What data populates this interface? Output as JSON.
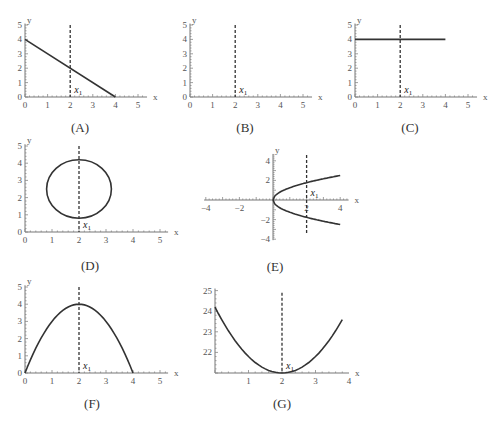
{
  "figure": {
    "panels": [
      {
        "id": "A",
        "label": "(A)",
        "x_axis": "x",
        "y_axis": "y",
        "marker": "x1"
      },
      {
        "id": "B",
        "label": "(B)",
        "x_axis": "x",
        "y_axis": "y",
        "marker": "x1"
      },
      {
        "id": "C",
        "label": "(C)",
        "x_axis": "x",
        "y_axis": "y",
        "marker": "x1"
      },
      {
        "id": "D",
        "label": "(D)",
        "x_axis": "x",
        "y_axis": "y",
        "marker": "x1"
      },
      {
        "id": "E",
        "label": "(E)",
        "x_axis": "x",
        "y_axis": "y",
        "marker": "x1"
      },
      {
        "id": "F",
        "label": "(F)",
        "x_axis": "x",
        "y_axis": "y",
        "marker": "x1"
      },
      {
        "id": "G",
        "label": "(G)",
        "x_axis": "",
        "y_axis": "",
        "marker": "x1"
      }
    ]
  },
  "chart_data": [
    {
      "id": "A",
      "type": "line",
      "title": "(A)",
      "xlabel": "x",
      "ylabel": "y",
      "xlim": [
        0,
        5
      ],
      "ylim": [
        0,
        5
      ],
      "xticks": [
        "0",
        "1",
        "2",
        "3",
        "4",
        "5"
      ],
      "yticks": [
        "0",
        "1",
        "2",
        "3",
        "4",
        "5"
      ],
      "series": [
        {
          "name": "line",
          "x": [
            0,
            4
          ],
          "y": [
            4,
            0
          ]
        }
      ],
      "annotations": [
        {
          "type": "vline-dashed",
          "x": 2,
          "label": "x1"
        }
      ]
    },
    {
      "id": "B",
      "type": "line",
      "title": "(B)",
      "xlabel": "x",
      "ylabel": "y",
      "xlim": [
        0,
        5
      ],
      "ylim": [
        0,
        5
      ],
      "xticks": [
        "0",
        "1",
        "2",
        "3",
        "4",
        "5"
      ],
      "yticks": [
        "0",
        "1",
        "2",
        "3",
        "4",
        "5"
      ],
      "series": [],
      "annotations": [
        {
          "type": "vline-dashed",
          "x": 2,
          "label": "x1"
        }
      ]
    },
    {
      "id": "C",
      "type": "line",
      "title": "(C)",
      "xlabel": "x",
      "ylabel": "y",
      "xlim": [
        0,
        5
      ],
      "ylim": [
        0,
        5
      ],
      "xticks": [
        "0",
        "1",
        "2",
        "3",
        "4",
        "5"
      ],
      "yticks": [
        "0",
        "1",
        "2",
        "3",
        "4",
        "5"
      ],
      "series": [
        {
          "name": "horizontal",
          "x": [
            0,
            4
          ],
          "y": [
            4,
            4
          ]
        }
      ],
      "annotations": [
        {
          "type": "vline-dashed",
          "x": 2,
          "label": "x1"
        }
      ]
    },
    {
      "id": "D",
      "type": "line",
      "title": "(D)",
      "xlabel": "x",
      "ylabel": "y",
      "xlim": [
        0,
        5
      ],
      "ylim": [
        0,
        5
      ],
      "xticks": [
        "0",
        "1",
        "2",
        "3",
        "4",
        "5"
      ],
      "yticks": [
        "0",
        "1",
        "2",
        "3",
        "4",
        "5"
      ],
      "series": [
        {
          "name": "ellipse",
          "center": [
            2,
            2.5
          ],
          "rx": 1.2,
          "ry": 1.7
        }
      ],
      "annotations": [
        {
          "type": "vline-dashed",
          "x": 2,
          "label": "x1"
        }
      ]
    },
    {
      "id": "E",
      "type": "line",
      "title": "(E)",
      "xlabel": "x",
      "ylabel": "y",
      "xlim": [
        -4,
        4.5
      ],
      "ylim": [
        -4,
        4.5
      ],
      "xticks": [
        "-4",
        "-2",
        "2",
        "4"
      ],
      "yticks": [
        "-4",
        "-2",
        "2",
        "4"
      ],
      "series": [
        {
          "name": "upper branch",
          "x": [
            0,
            1,
            2,
            3,
            4
          ],
          "y": [
            0,
            1.25,
            1.77,
            2.17,
            2.5
          ]
        },
        {
          "name": "lower branch",
          "x": [
            0,
            1,
            2,
            3,
            4
          ],
          "y": [
            0,
            -1.25,
            -1.77,
            -2.17,
            -2.5
          ]
        }
      ],
      "annotations": [
        {
          "type": "vline-dashed",
          "x": 2,
          "label": "x1"
        }
      ]
    },
    {
      "id": "F",
      "type": "line",
      "title": "(F)",
      "xlabel": "x",
      "ylabel": "y",
      "xlim": [
        0,
        5
      ],
      "ylim": [
        0,
        5
      ],
      "xticks": [
        "0",
        "1",
        "2",
        "3",
        "4",
        "5"
      ],
      "yticks": [
        "0",
        "1",
        "2",
        "3",
        "4",
        "5"
      ],
      "series": [
        {
          "name": "parabola",
          "x": [
            0,
            1,
            2,
            3,
            4
          ],
          "y": [
            0,
            3,
            4,
            3,
            0
          ]
        }
      ],
      "annotations": [
        {
          "type": "vline-dashed",
          "x": 2,
          "label": "x1"
        }
      ]
    },
    {
      "id": "G",
      "type": "line",
      "title": "(G)",
      "xlabel": "x",
      "ylabel": "",
      "xlim": [
        0,
        4
      ],
      "ylim": [
        21,
        25
      ],
      "xticks": [
        "1",
        "2",
        "3",
        "4"
      ],
      "yticks": [
        "22",
        "23",
        "24",
        "25"
      ],
      "series": [
        {
          "name": "parabola",
          "x": [
            0,
            1,
            2,
            3,
            3.8
          ],
          "y": [
            24.2,
            21.8,
            21,
            21.8,
            24.1
          ]
        }
      ],
      "annotations": [
        {
          "type": "vline-dashed",
          "x": 2,
          "label": "x1"
        }
      ]
    }
  ]
}
